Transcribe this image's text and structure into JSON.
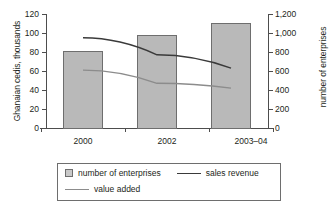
{
  "chart_data": {
    "type": "bar",
    "title": "",
    "subtitle": "",
    "categories": [
      "2000",
      "2002",
      "2003–04"
    ],
    "xlabel": "",
    "ylabel": "Ghanaian cedis, thousands",
    "ylabel_secondary": "number of enterprises",
    "ylim": [
      0,
      120
    ],
    "ylim_secondary": [
      0,
      1200
    ],
    "yticks": [
      0,
      20,
      40,
      60,
      80,
      100,
      120
    ],
    "ytick_labels": [
      "0",
      "20",
      "40",
      "60",
      "80",
      "100",
      "120"
    ],
    "yticks_secondary": [
      0,
      200,
      400,
      600,
      800,
      1000,
      1200
    ],
    "ytick_labels_secondary": [
      "0",
      "200",
      "400",
      "600",
      "800",
      "1,000",
      "1,200"
    ],
    "grid": false,
    "legend_position": "bottom",
    "series": [
      {
        "name": "number of enterprises",
        "type": "bar",
        "axis": "right",
        "values": [
          810,
          975,
          1110
        ],
        "color": "#b9b9b9",
        "edge_color": "#6e6e6e"
      },
      {
        "name": "sales revenue",
        "type": "line",
        "axis": "left",
        "values": [
          95,
          77,
          63
        ],
        "color": "#3a3a3a"
      },
      {
        "name": "value added",
        "type": "line",
        "axis": "left",
        "values": [
          61,
          47,
          42
        ],
        "color": "#8c8c8c"
      }
    ]
  },
  "axes": {
    "left_title": "Ghanaian cedis, thousands",
    "right_title": "number of enterprises",
    "left_ticks": [
      "120",
      "100",
      "80",
      "60",
      "40",
      "20",
      "0"
    ],
    "right_ticks": [
      "1,200",
      "1,000",
      "800",
      "600",
      "400",
      "200",
      "0"
    ],
    "x_ticks": [
      "2000",
      "2002",
      "2003–04"
    ]
  },
  "legend": {
    "item_bars": "number of enterprises",
    "item_line_1": "sales revenue",
    "item_line_2": "value added"
  }
}
